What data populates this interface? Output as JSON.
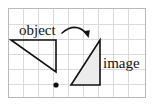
{
  "figure": {
    "background": "#ffffff",
    "frame": {
      "border_color": "#b9b9b9",
      "x": 8,
      "y": 8,
      "width": 138,
      "height": 90
    },
    "grid": {
      "visible": true,
      "line_color": "#d9d9d9",
      "cell_size": 15,
      "columns": 9,
      "rows": 6
    },
    "labels": {
      "object": "object",
      "image": "image"
    },
    "shapes": {
      "object_triangle": {
        "name": "object",
        "stroke": "#111111",
        "stroke_width": 1.6,
        "fill": "none",
        "points": "11,40 56,40 56,72"
      },
      "image_triangle": {
        "name": "image",
        "stroke": "#111111",
        "stroke_width": 1.6,
        "fill": "#ececec",
        "points": "71,85 100,85 100,40"
      },
      "center_dot": {
        "name": "center-of-rotation",
        "color": "#111111",
        "cx": 56,
        "cy": 85,
        "r": 2.6
      },
      "rotation_arrow": {
        "name": "rotation-arrow",
        "color": "#111111",
        "stroke_width": 1.6,
        "path": "M 62 33 Q 76 22 87 34"
      }
    }
  }
}
